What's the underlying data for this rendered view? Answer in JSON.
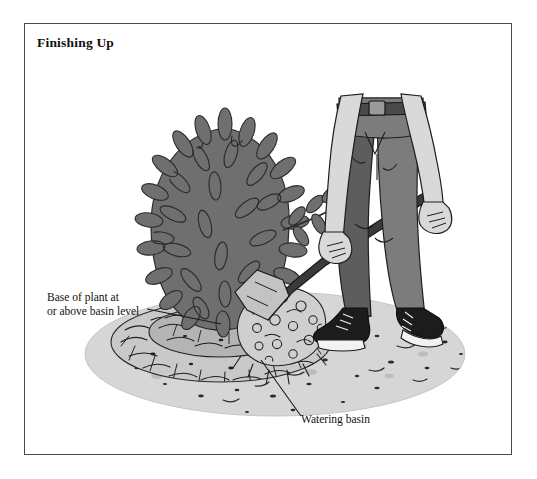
{
  "figure": {
    "title": "Finishing Up",
    "frame_border_color": "#4a4a4a",
    "background_color": "#ffffff"
  },
  "callouts": [
    {
      "id": "base-of-plant",
      "text": "Base of plant at\nor above basin level",
      "leader": "line from label to soil mound at plant base"
    },
    {
      "id": "watering-basin",
      "text": "Watering basin",
      "leader": "line from label up-left to raised soil ring"
    }
  ],
  "scene": {
    "description": "Person in dark trousers and sneakers using a shovel to spread mulch around a newly planted shrub set inside a circular watering basin",
    "objects": [
      "shrub",
      "shrub-branch",
      "plant-stem",
      "watering-basin-ring",
      "mulch-pile",
      "shovel",
      "gardener-legs",
      "gardener-arms",
      "belt",
      "left-shoe",
      "right-shoe",
      "ground-patch"
    ],
    "colors": {
      "shrub_fill": "#6f6f6f",
      "shrub_outline": "#2b2b2b",
      "pants_fill": "#7c7c7c",
      "pants_shadow": "#5d5d5d",
      "skin_fill": "#d9d9d9",
      "shoe_fill": "#1c1c1c",
      "shoe_sole": "#f2f2f2",
      "shovel_handle": "#3a3a3a",
      "shovel_blade": "#c3c3c3",
      "ground_fill": "#d6d6d6",
      "basin_fill": "#b9b9b9",
      "basin_rim": "#9a9a9a",
      "mulch_fill": "#cccccc",
      "stem_fill": "#4c4c4c",
      "ink": "#1a1a1a"
    }
  }
}
